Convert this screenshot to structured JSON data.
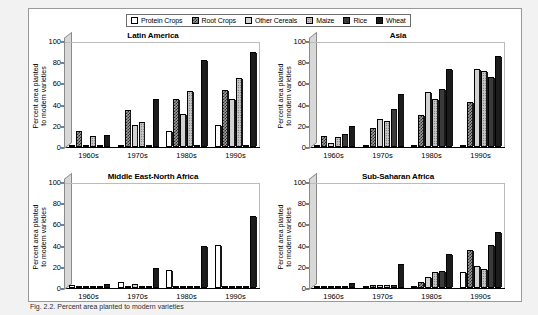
{
  "figure": {
    "caption": "Fig. 2.2.  Percent area planted to modern varieties",
    "ylabel_line1": "Percent area planted",
    "ylabel_line2": "to modern varieties",
    "y_ticks": [
      "0",
      "20",
      "40",
      "60",
      "80",
      "100"
    ],
    "categories": [
      "1960s",
      "1970s",
      "1980s",
      "1990s"
    ]
  },
  "legend": {
    "items": [
      {
        "label": "Protein Crops",
        "pattern": "p-protein",
        "icon": "swatch-protein-crops"
      },
      {
        "label": "Root Crops",
        "pattern": "p-root",
        "icon": "swatch-root-crops"
      },
      {
        "label": "Other Cereals",
        "pattern": "p-othercereals",
        "icon": "swatch-other-cereals"
      },
      {
        "label": "Maize",
        "pattern": "p-maize",
        "icon": "swatch-maize"
      },
      {
        "label": "Rice",
        "pattern": "p-rice",
        "icon": "swatch-rice"
      },
      {
        "label": "Wheat",
        "pattern": "p-wheat",
        "icon": "swatch-wheat"
      }
    ]
  },
  "chart_data": [
    {
      "type": "bar",
      "title": "Latin America",
      "xlabel": "",
      "ylabel": "Percent area planted to modern varieties",
      "ylim": [
        0,
        100
      ],
      "grid": false,
      "legend_position": "top-center-shared",
      "categories": [
        "1960s",
        "1970s",
        "1980s",
        "1990s"
      ],
      "series": [
        {
          "name": "Protein Crops",
          "values": [
            1,
            2,
            15,
            21
          ]
        },
        {
          "name": "Root Crops",
          "values": [
            15,
            35,
            45,
            54
          ]
        },
        {
          "name": "Other Cereals",
          "values": [
            2,
            21,
            31,
            45
          ]
        },
        {
          "name": "Maize",
          "values": [
            10,
            24,
            53,
            65
          ]
        },
        {
          "name": "Rice",
          "values": [
            1,
            1,
            1,
            1
          ]
        },
        {
          "name": "Wheat",
          "values": [
            11,
            45,
            82,
            90
          ]
        }
      ]
    },
    {
      "type": "bar",
      "title": "Asia",
      "xlabel": "",
      "ylabel": "Percent area planted to modern varieties",
      "ylim": [
        0,
        100
      ],
      "grid": false,
      "legend_position": "top-center-shared",
      "categories": [
        "1960s",
        "1970s",
        "1980s",
        "1990s"
      ],
      "series": [
        {
          "name": "Protein Crops",
          "values": [
            1,
            1,
            1,
            1
          ]
        },
        {
          "name": "Root Crops",
          "values": [
            10,
            18,
            30,
            42
          ]
        },
        {
          "name": "Other Cereals",
          "values": [
            4,
            26,
            52,
            74
          ]
        },
        {
          "name": "Maize",
          "values": [
            9,
            25,
            45,
            72
          ]
        },
        {
          "name": "Rice",
          "values": [
            12,
            36,
            55,
            66
          ]
        },
        {
          "name": "Wheat",
          "values": [
            20,
            50,
            74,
            86
          ]
        }
      ]
    },
    {
      "type": "bar",
      "title": "Middle East-North Africa",
      "xlabel": "",
      "ylabel": "Percent area planted to modern varieties",
      "ylim": [
        0,
        100
      ],
      "grid": false,
      "legend_position": "top-center-shared",
      "categories": [
        "1960s",
        "1970s",
        "1980s",
        "1990s"
      ],
      "series": [
        {
          "name": "Protein Crops",
          "values": [
            3,
            6,
            17,
            41
          ]
        },
        {
          "name": "Root Crops",
          "values": [
            0,
            0,
            0,
            0
          ]
        },
        {
          "name": "Other Cereals",
          "values": [
            0,
            4,
            0,
            0
          ]
        },
        {
          "name": "Maize",
          "values": [
            0,
            0,
            0,
            0
          ]
        },
        {
          "name": "Rice",
          "values": [
            0,
            0,
            0,
            0
          ]
        },
        {
          "name": "Wheat",
          "values": [
            4,
            19,
            40,
            68
          ]
        }
      ]
    },
    {
      "type": "bar",
      "title": "Sub-Saharan Africa",
      "xlabel": "",
      "ylabel": "Percent area planted to modern varieties",
      "ylim": [
        0,
        100
      ],
      "grid": false,
      "legend_position": "top-center-shared",
      "categories": [
        "1960s",
        "1970s",
        "1980s",
        "1990s"
      ],
      "series": [
        {
          "name": "Protein Crops",
          "values": [
            1,
            1,
            2,
            15
          ]
        },
        {
          "name": "Root Crops",
          "values": [
            1,
            3,
            6,
            36
          ]
        },
        {
          "name": "Other Cereals",
          "values": [
            1,
            3,
            10,
            21
          ]
        },
        {
          "name": "Maize",
          "values": [
            1,
            3,
            15,
            18
          ]
        },
        {
          "name": "Rice",
          "values": [
            1,
            3,
            16,
            41
          ]
        },
        {
          "name": "Wheat",
          "values": [
            5,
            23,
            32,
            53
          ]
        }
      ]
    }
  ]
}
